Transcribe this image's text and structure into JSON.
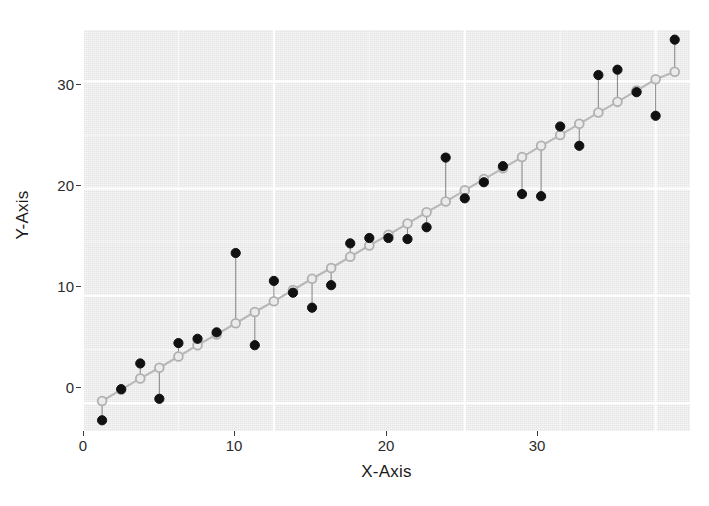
{
  "axes": {
    "x_title": "X-Axis",
    "y_title": "Y-Axis",
    "x_ticks": [
      "0",
      "10",
      "20",
      "30"
    ],
    "y_ticks": [
      "0",
      "10",
      "20",
      "30"
    ]
  },
  "colors": {
    "panel_background": "#ebebeb",
    "grid_major": "#ffffff",
    "grid_minor": "#f5f5f5",
    "fitted_point": "#b0b0b0",
    "fitted_line": "#b8b8b8",
    "observed_point": "#111111",
    "residual_segment": "#8c8c8c",
    "text": "#1a1a1a"
  },
  "chart_data": {
    "type": "scatter",
    "title": "",
    "subtitle": "",
    "xlabel": "X-Axis",
    "ylabel": "Y-Axis",
    "xlim": [
      0,
      31.8
    ],
    "ylim": [
      -2.6,
      34.8
    ],
    "xticks": [
      0,
      10,
      20,
      30
    ],
    "yticks": [
      0,
      10,
      20,
      30
    ],
    "grid": true,
    "legend": "none",
    "annotations": [
      "Open grey circles are fitted values lying on the regression line",
      "Filled black circles are observed values",
      "Thin grey vertical segments are residuals connecting fitted to observed"
    ],
    "x": [
      1,
      2,
      3,
      4,
      5,
      6,
      7,
      8,
      9,
      10,
      11,
      12,
      13,
      14,
      15,
      16,
      17,
      18,
      19,
      20,
      21,
      22,
      23,
      24,
      25,
      26,
      27,
      28,
      29,
      30,
      31
    ],
    "series": [
      {
        "name": "Fitted",
        "marker": "open-circle",
        "values": [
          0.2,
          1.25,
          2.3,
          3.3,
          4.35,
          5.4,
          6.4,
          7.45,
          8.5,
          9.5,
          10.55,
          11.6,
          12.6,
          13.65,
          14.7,
          15.7,
          16.75,
          17.8,
          18.8,
          19.85,
          20.9,
          21.9,
          22.95,
          24.0,
          25.0,
          26.05,
          27.1,
          28.1,
          29.15,
          30.2,
          30.9
        ]
      },
      {
        "name": "Observed",
        "marker": "filled-circle",
        "values": [
          -1.6,
          1.3,
          3.7,
          0.4,
          5.6,
          6.0,
          6.6,
          14.0,
          5.4,
          11.4,
          10.3,
          8.9,
          11.0,
          14.9,
          15.4,
          15.4,
          15.3,
          16.4,
          22.9,
          19.1,
          20.6,
          22.1,
          19.5,
          19.3,
          25.8,
          24.0,
          30.6,
          31.1,
          29.0,
          26.8,
          33.9
        ]
      }
    ],
    "residuals": [
      -1.8,
      0.05,
      1.4,
      -2.9,
      1.25,
      0.6,
      0.2,
      6.55,
      -3.1,
      1.9,
      -0.25,
      -2.7,
      -1.6,
      1.25,
      0.7,
      -0.3,
      -1.45,
      -1.4,
      4.1,
      -0.75,
      -0.3,
      0.2,
      -3.45,
      -4.7,
      0.8,
      -2.05,
      3.5,
      3.0,
      -0.15,
      -3.4,
      3.0
    ]
  }
}
